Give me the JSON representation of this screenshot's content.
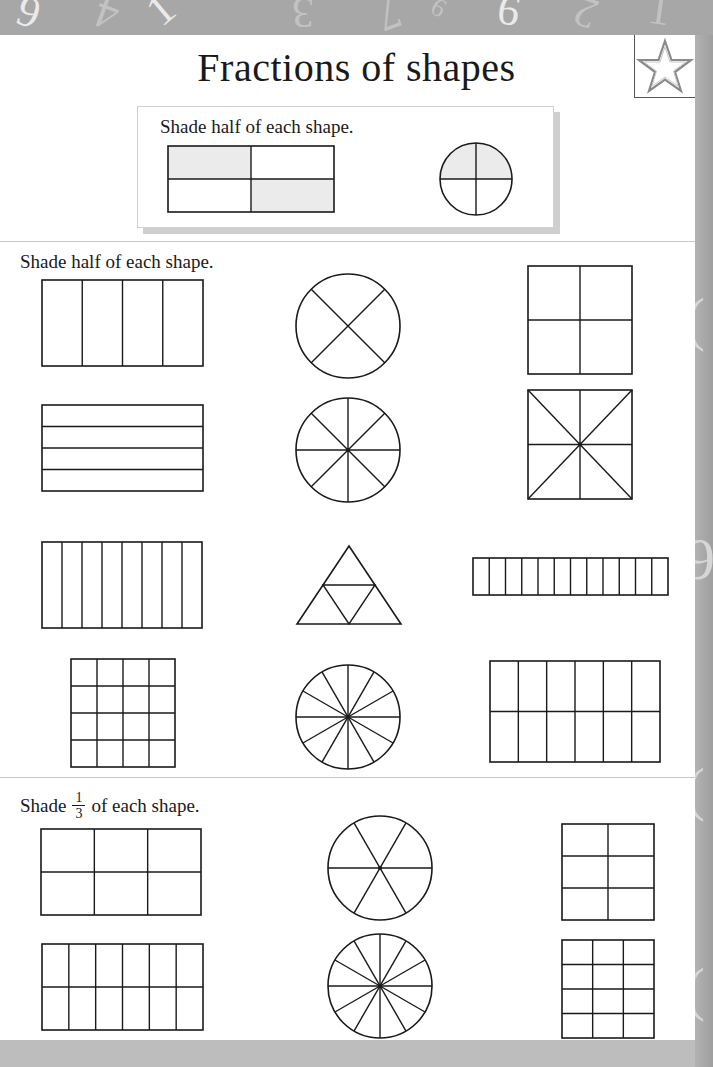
{
  "page": {
    "title": "Fractions of shapes",
    "badge_icon": "star-icon"
  },
  "header_decoration": {
    "numbers": [
      "6",
      "4",
      "1",
      "3",
      "7",
      "6",
      "9",
      "2",
      "1"
    ]
  },
  "example": {
    "instruction": "Shade half of each shape.",
    "shapes": [
      {
        "type": "rect-grid",
        "label": "example-rectangle",
        "x": 168,
        "y": 146,
        "w": 166,
        "h": 66,
        "cols": 2,
        "rows": 2,
        "shaded_cells": [
          [
            0,
            0
          ],
          [
            1,
            1
          ]
        ]
      },
      {
        "type": "circle-quarters",
        "label": "example-circle",
        "cx": 476,
        "cy": 179,
        "r": 36,
        "shaded": "top-half"
      }
    ],
    "shade_color": "#ebebeb"
  },
  "section_half": {
    "instruction": "Shade half of each shape.",
    "shapes": [
      {
        "type": "rect-grid",
        "label": "rectangle-4-columns",
        "x": 42,
        "y": 280,
        "w": 161,
        "h": 86,
        "cols": 4,
        "rows": 1
      },
      {
        "type": "circle-x",
        "label": "circle-4-sectors",
        "cx": 348,
        "cy": 326,
        "r": 52
      },
      {
        "type": "rect-grid",
        "label": "square-2x2",
        "x": 528,
        "y": 266,
        "w": 104,
        "h": 108,
        "cols": 2,
        "rows": 2
      },
      {
        "type": "rect-grid",
        "label": "rectangle-4-rows",
        "x": 42,
        "y": 405,
        "w": 161,
        "h": 86,
        "cols": 1,
        "rows": 4
      },
      {
        "type": "circle-sectors",
        "label": "circle-8-sectors",
        "cx": 348,
        "cy": 450,
        "r": 52,
        "sectors": 8
      },
      {
        "type": "square-star",
        "label": "square-8-triangles",
        "x": 528,
        "y": 390,
        "w": 104,
        "h": 109
      },
      {
        "type": "rect-grid",
        "label": "rectangle-8-columns",
        "x": 42,
        "y": 542,
        "w": 160,
        "h": 86,
        "cols": 8,
        "rows": 1
      },
      {
        "type": "triangle-4",
        "label": "triangle-4-parts",
        "ax": 349,
        "ay": 546,
        "bx": 297,
        "by": 624,
        "cx": 401,
        "cy": 624
      },
      {
        "type": "rect-grid",
        "label": "strip-12-columns",
        "x": 473,
        "y": 558,
        "w": 195,
        "h": 37,
        "cols": 12,
        "rows": 1
      },
      {
        "type": "rect-grid",
        "label": "grid-4x4",
        "x": 71,
        "y": 659,
        "w": 104,
        "h": 108,
        "cols": 4,
        "rows": 4
      },
      {
        "type": "circle-sectors",
        "label": "circle-12-sectors",
        "cx": 348,
        "cy": 717,
        "r": 52,
        "sectors": 12
      },
      {
        "type": "rect-grid",
        "label": "rectangle-6x2",
        "x": 490,
        "y": 661,
        "w": 170,
        "h": 101,
        "cols": 6,
        "rows": 2
      }
    ]
  },
  "section_third": {
    "instruction_prefix": "Shade",
    "fraction_numerator": "1",
    "fraction_denominator": "3",
    "instruction_suffix": "of each shape.",
    "shapes": [
      {
        "type": "rect-grid",
        "label": "rectangle-3x2",
        "x": 41,
        "y": 829,
        "w": 160,
        "h": 86,
        "cols": 3,
        "rows": 2
      },
      {
        "type": "circle-sectors",
        "label": "circle-6-sectors",
        "cx": 380,
        "cy": 868,
        "r": 52,
        "sectors": 6,
        "offset_deg": 0
      },
      {
        "type": "rect-grid",
        "label": "grid-2x3",
        "x": 562,
        "y": 824,
        "w": 92,
        "h": 96,
        "cols": 2,
        "rows": 3
      },
      {
        "type": "rect-grid",
        "label": "rectangle-6x2-thirds",
        "x": 42,
        "y": 944,
        "w": 161,
        "h": 86,
        "cols": 6,
        "rows": 2
      },
      {
        "type": "circle-sectors",
        "label": "circle-12-sectors-thirds",
        "cx": 380,
        "cy": 986,
        "r": 52,
        "sectors": 12
      },
      {
        "type": "rect-grid",
        "label": "grid-3x4",
        "x": 562,
        "y": 940,
        "w": 92,
        "h": 98,
        "cols": 3,
        "rows": 4
      }
    ]
  },
  "colors": {
    "ink": "#1a1a1a",
    "page": "#ffffff",
    "band": "#a7a7a7",
    "divider": "#c8c8c8",
    "shade": "#ebebeb"
  }
}
